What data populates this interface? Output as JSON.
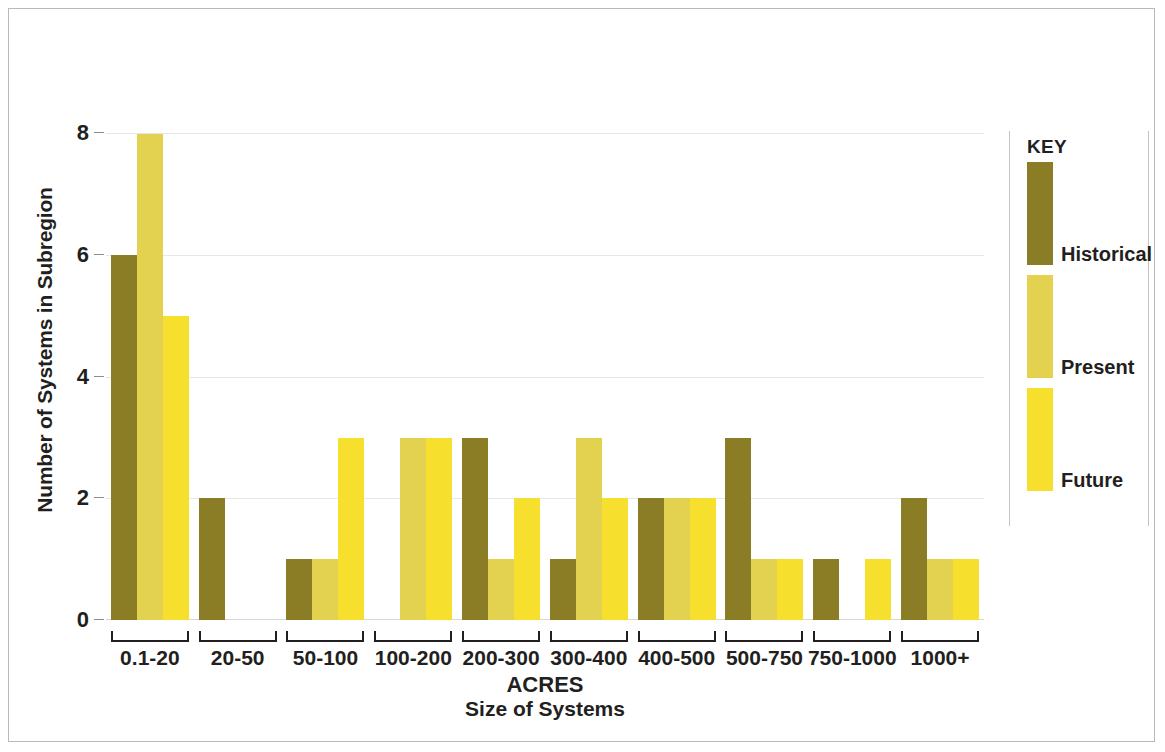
{
  "chart_data": {
    "type": "bar",
    "title": "",
    "xlabel": "ACRES",
    "xlabel_sub": "Size of Systems",
    "ylabel": "Number of Systems in Subregion",
    "ylim": [
      0,
      8.6
    ],
    "yticks": [
      0,
      2,
      4,
      6,
      8
    ],
    "grid": true,
    "legend_position": "right",
    "legend_title": "KEY",
    "categories": [
      "0.1-20",
      "20-50",
      "50-100",
      "100-200",
      "200-300",
      "300-400",
      "400-500",
      "500-750",
      "750-1000",
      "1000+"
    ],
    "series": [
      {
        "name": "Historical",
        "color": "#8a7d25",
        "values": [
          6,
          2,
          1,
          0,
          3,
          1,
          2,
          3,
          1,
          2
        ]
      },
      {
        "name": "Present",
        "color": "#e2d24f",
        "values": [
          8,
          0,
          1,
          3,
          1,
          3,
          2,
          1,
          0,
          1
        ]
      },
      {
        "name": "Future",
        "color": "#f7e02d",
        "values": [
          5,
          0,
          3,
          3,
          2,
          2,
          2,
          1,
          1,
          1
        ]
      }
    ]
  },
  "colors": {
    "historical": "#8a7d25",
    "present": "#e2d24f",
    "future": "#f7e02d",
    "text": "#231f20",
    "grid": "#e7e7e7",
    "border": "#b9b9b9"
  }
}
